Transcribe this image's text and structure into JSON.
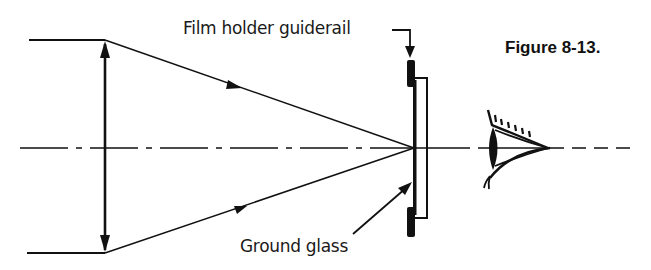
{
  "figure": {
    "caption": "Figure 8-13.",
    "labels": {
      "guiderail": "Film holder guiderail",
      "ground_glass": "Ground glass"
    },
    "elements": [
      "optical-axis",
      "lens",
      "upper-ray",
      "lower-ray",
      "film-holder-guiderail",
      "ground-glass",
      "eye"
    ],
    "colors": {
      "ink": "#111111",
      "background": "#ffffff"
    }
  }
}
